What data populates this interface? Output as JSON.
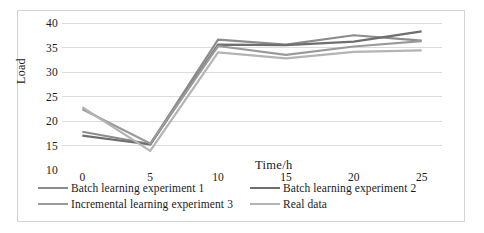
{
  "chart_data": {
    "type": "line",
    "title": "",
    "xlabel": "Time/h",
    "ylabel": "Load",
    "xlim": [
      -1.5,
      26.5
    ],
    "ylim": [
      10,
      40
    ],
    "xticks": [
      0,
      5,
      10,
      15,
      20,
      25
    ],
    "yticks": [
      10,
      15,
      20,
      25,
      30,
      35,
      40
    ],
    "grid": "horizontal",
    "legend_position": "bottom",
    "x": [
      0,
      5,
      10,
      15,
      20,
      25
    ],
    "series": [
      {
        "name": "Batch learning experiment 1",
        "color": "#8c8c8c",
        "values": [
          17.8,
          15.3,
          36.6,
          35.6,
          37.5,
          36.4
        ]
      },
      {
        "name": "Batch learning experiment 2",
        "color": "#6e6e6e",
        "values": [
          17.0,
          15.2,
          35.6,
          35.5,
          36.2,
          38.3
        ]
      },
      {
        "name": "Incremental learning experiment 3",
        "color": "#9a9a9a",
        "values": [
          22.4,
          15.4,
          35.3,
          33.5,
          35.2,
          36.3
        ]
      },
      {
        "name": "Real data",
        "color": "#b4b4b4",
        "values": [
          22.8,
          13.9,
          34.0,
          32.8,
          34.1,
          34.4
        ]
      }
    ]
  },
  "axis": {
    "y_title": "Load",
    "x_title": "Time/h",
    "y_tick_labels": [
      "40",
      "35",
      "30",
      "25",
      "20",
      "15",
      "10"
    ],
    "x_tick_labels": [
      "0",
      "5",
      "10",
      "15",
      "20",
      "25"
    ]
  },
  "legend": {
    "items": [
      {
        "label": "Batch learning experiment 1",
        "color": "#8c8c8c"
      },
      {
        "label": "Batch learning experiment 2",
        "color": "#6e6e6e"
      },
      {
        "label": "Incremental learning experiment 3",
        "color": "#9a9a9a"
      },
      {
        "label": "Real data",
        "color": "#b4b4b4"
      }
    ]
  },
  "style": {
    "grid_color": "#dcdcdc",
    "frame_color": "#d3d3d3",
    "background": "#ffffff",
    "text_color": "#1a1a1a"
  }
}
